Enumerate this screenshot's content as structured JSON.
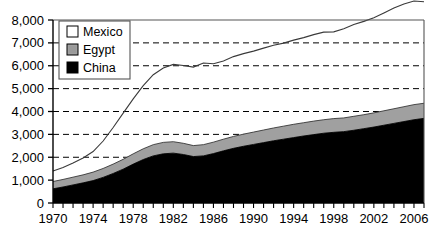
{
  "chart_data": {
    "type": "area",
    "stacked": true,
    "title": "",
    "subtitle": "",
    "xlabel": "",
    "ylabel": "",
    "xlim": [
      1970,
      2007
    ],
    "ylim": [
      0,
      8000
    ],
    "ytick_step": 1000,
    "xtick_step": 1,
    "xlabel_step": 4,
    "grid": "horizontal-dashed",
    "gridlines": [
      2000,
      3000,
      4000,
      5000,
      6000,
      7000
    ],
    "legend_position": "top-left-inside",
    "x": [
      1970,
      1971,
      1972,
      1973,
      1974,
      1975,
      1976,
      1977,
      1978,
      1979,
      1980,
      1981,
      1982,
      1983,
      1984,
      1985,
      1986,
      1987,
      1988,
      1989,
      1990,
      1991,
      1992,
      1993,
      1994,
      1995,
      1996,
      1997,
      1998,
      1999,
      2000,
      2001,
      2002,
      2003,
      2004,
      2005,
      2006,
      2007
    ],
    "xticklabels": [
      "1970",
      "1974",
      "1978",
      "1982",
      "1986",
      "1990",
      "1994",
      "1998",
      "2002",
      "2006"
    ],
    "yticklabels": [
      "0",
      "1,000",
      "2,000",
      "3,000",
      "4,000",
      "5,000",
      "6,000",
      "7,000",
      "8,000"
    ],
    "series": [
      {
        "name": "China",
        "color": "#000000",
        "order": 1,
        "values": [
          620,
          700,
          790,
          880,
          980,
          1120,
          1290,
          1480,
          1700,
          1900,
          2060,
          2150,
          2180,
          2120,
          2030,
          2060,
          2160,
          2280,
          2390,
          2480,
          2560,
          2640,
          2720,
          2790,
          2860,
          2930,
          2990,
          3050,
          3090,
          3120,
          3180,
          3250,
          3320,
          3400,
          3480,
          3560,
          3640,
          3700
        ]
      },
      {
        "name": "Egypt",
        "color": "#a0a0a0",
        "order": 2,
        "values": [
          320,
          330,
          340,
          350,
          370,
          390,
          410,
          430,
          450,
          470,
          490,
          500,
          500,
          490,
          480,
          490,
          500,
          510,
          520,
          530,
          540,
          550,
          560,
          570,
          580,
          580,
          590,
          590,
          600,
          600,
          610,
          610,
          620,
          630,
          640,
          650,
          660,
          660
        ]
      },
      {
        "name": "Mexico",
        "color": "#ffffff",
        "order": 3,
        "values": [
          460,
          520,
          620,
          740,
          900,
          1200,
          1600,
          2020,
          2400,
          2760,
          3060,
          3250,
          3380,
          3400,
          3430,
          3570,
          3430,
          3420,
          3490,
          3520,
          3540,
          3580,
          3620,
          3630,
          3680,
          3720,
          3780,
          3830,
          3790,
          3900,
          4010,
          4080,
          4160,
          4280,
          4400,
          4490,
          4530,
          4440
        ]
      }
    ],
    "totals": [
      1400,
      1550,
      1750,
      1970,
      2250,
      2710,
      3300,
      3930,
      4550,
      5130,
      5610,
      5900,
      6060,
      6010,
      5940,
      6120,
      6090,
      6210,
      6400,
      6530,
      6640,
      6770,
      6900,
      6990,
      7120,
      7230,
      7360,
      7470,
      7480,
      7620,
      7800,
      7940,
      8100,
      8310,
      8520,
      8700,
      8830,
      8800
    ]
  },
  "legend": {
    "items": [
      {
        "label": "Mexico",
        "color": "#ffffff"
      },
      {
        "label": "Egypt",
        "color": "#a0a0a0"
      },
      {
        "label": "China",
        "color": "#000000"
      }
    ]
  }
}
